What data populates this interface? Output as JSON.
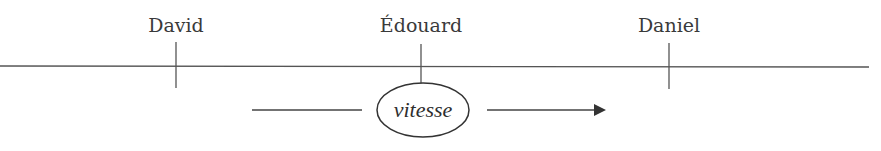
{
  "diagram": {
    "timeline": {
      "color": "#555555"
    },
    "markers": [
      {
        "label": "David",
        "x": 176
      },
      {
        "label": "Édouard",
        "x": 421
      },
      {
        "label": "Daniel",
        "x": 669
      }
    ],
    "center_node": {
      "label": "vitesse"
    },
    "arrow": {
      "direction": "right"
    }
  }
}
